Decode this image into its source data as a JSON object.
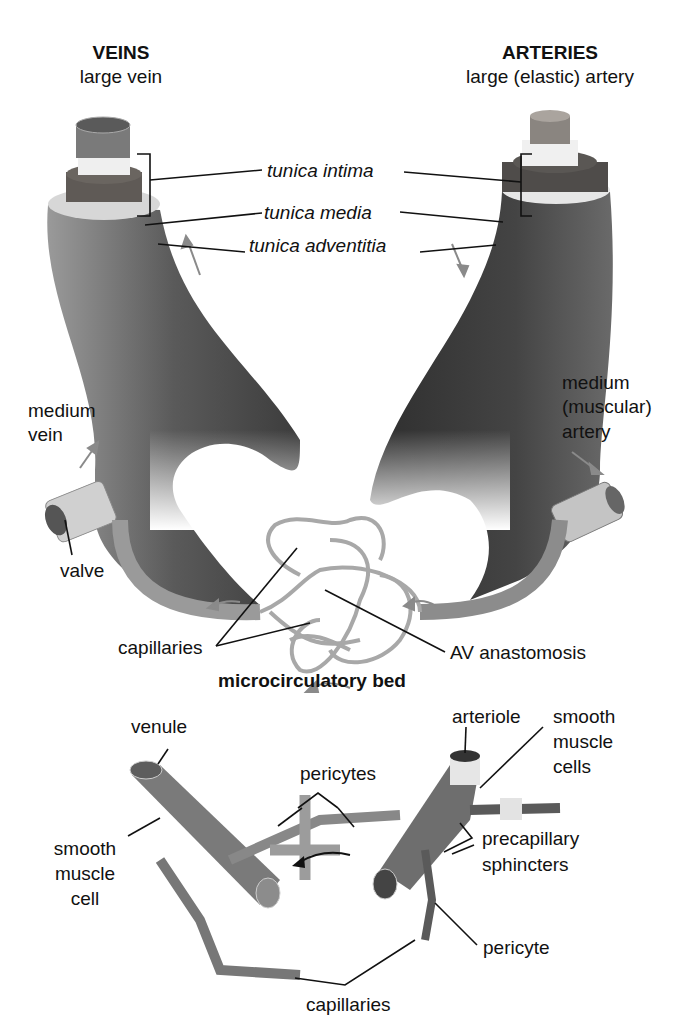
{
  "headers": {
    "veins": {
      "title": "VEINS",
      "subtitle": "large vein"
    },
    "arteries": {
      "title": "ARTERIES",
      "subtitle": "large (elastic) artery"
    }
  },
  "layers": {
    "intima": "tunica intima",
    "media": "tunica  media",
    "adventitia": "tunica  adventitia"
  },
  "labels": {
    "medium_vein": [
      "medium",
      "vein"
    ],
    "valve": "valve",
    "medium_artery": [
      "medium",
      "(muscular)",
      "artery"
    ],
    "capillaries_top": "capillaries",
    "av_anastomosis": "AV anastomosis",
    "microcirculatory_bed": "microcirculatory bed",
    "venule": "venule",
    "arteriole": "arteriole",
    "smooth_muscle_cells": [
      "smooth",
      "muscle",
      "cells"
    ],
    "pericytes": "pericytes",
    "smooth_muscle_cell": [
      "smooth",
      "muscle",
      "cell"
    ],
    "precapillary_sphincters": [
      "precapillary",
      "sphincters"
    ],
    "pericyte": "pericyte",
    "capillaries_bottom": "capillaries"
  },
  "colors": {
    "vessel_dark": "#3a3a3a",
    "vessel_mid": "#7a7a7a",
    "vessel_light": "#bdbdbd",
    "arrow": "#8a8a8a",
    "line": "#111111"
  }
}
